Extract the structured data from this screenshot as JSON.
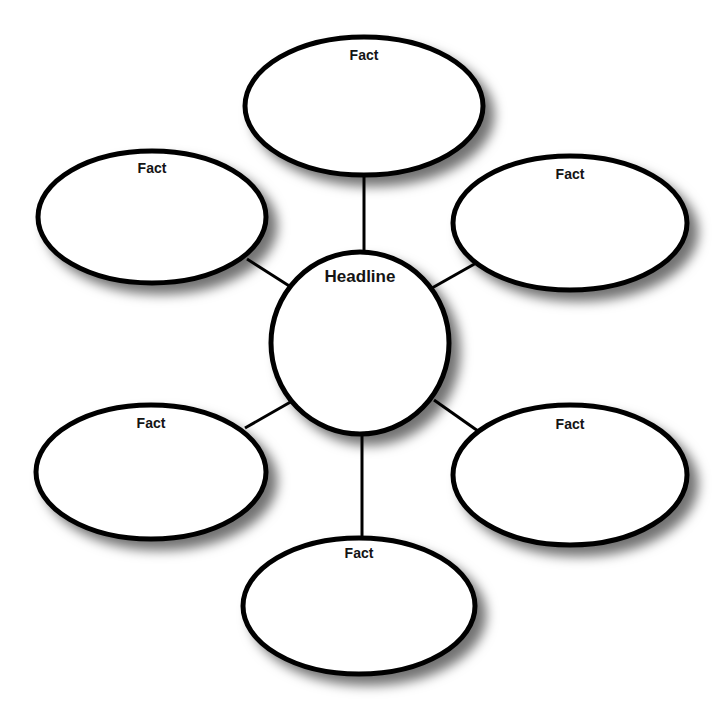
{
  "diagram": {
    "type": "web-organizer",
    "background_color": "#ffffff",
    "stroke_color": "#000000",
    "label_color": "#141414",
    "center": {
      "id": "headline",
      "label": "Headline",
      "shape": "circle",
      "cx": 360,
      "cy": 343,
      "rx": 89,
      "ry": 91,
      "stroke_width": 5,
      "label_dy": -65
    },
    "satellites": [
      {
        "id": "fact-top",
        "label": "Fact",
        "shape": "ellipse",
        "cx": 364,
        "cy": 106,
        "rx": 119,
        "ry": 69,
        "stroke_width": 5,
        "label_dy": -50
      },
      {
        "id": "fact-upper-left",
        "label": "Fact",
        "shape": "ellipse",
        "cx": 152,
        "cy": 217,
        "rx": 114,
        "ry": 66,
        "stroke_width": 5,
        "label_dy": -48
      },
      {
        "id": "fact-upper-right",
        "label": "Fact",
        "shape": "ellipse",
        "cx": 570,
        "cy": 223,
        "rx": 117,
        "ry": 67,
        "stroke_width": 5,
        "label_dy": -48
      },
      {
        "id": "fact-lower-left",
        "label": "Fact",
        "shape": "ellipse",
        "cx": 151,
        "cy": 472,
        "rx": 115,
        "ry": 67,
        "stroke_width": 5,
        "label_dy": -48
      },
      {
        "id": "fact-lower-right",
        "label": "Fact",
        "shape": "ellipse",
        "cx": 570,
        "cy": 475,
        "rx": 117,
        "ry": 70,
        "stroke_width": 5,
        "label_dy": -50
      },
      {
        "id": "fact-bottom",
        "label": "Fact",
        "shape": "ellipse",
        "cx": 359,
        "cy": 606,
        "rx": 116,
        "ry": 68,
        "stroke_width": 5,
        "label_dy": -52
      }
    ],
    "connectors": [
      {
        "id": "connector-top",
        "from": "headline",
        "to": "fact-top",
        "x1": 364,
        "y1": 254,
        "x2": 364,
        "y2": 173
      },
      {
        "id": "connector-upper-left",
        "from": "headline",
        "to": "fact-upper-left",
        "x1": 294,
        "y1": 289,
        "x2": 247,
        "y2": 259
      },
      {
        "id": "connector-upper-right",
        "from": "headline",
        "to": "fact-upper-right",
        "x1": 432,
        "y1": 288,
        "x2": 478,
        "y2": 262
      },
      {
        "id": "connector-lower-left",
        "from": "headline",
        "to": "fact-lower-left",
        "x1": 294,
        "y1": 400,
        "x2": 245,
        "y2": 428
      },
      {
        "id": "connector-lower-right",
        "from": "headline",
        "to": "fact-lower-right",
        "x1": 434,
        "y1": 400,
        "x2": 478,
        "y2": 431
      },
      {
        "id": "connector-bottom",
        "from": "headline",
        "to": "fact-bottom",
        "x1": 362,
        "y1": 433,
        "x2": 362,
        "y2": 540
      }
    ]
  }
}
